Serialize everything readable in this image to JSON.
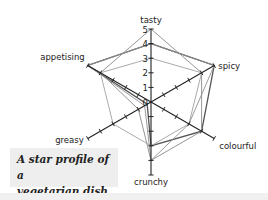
{
  "caption": {
    "line1": "A star profile of a",
    "line2": "vegetarian dish"
  },
  "chart_data": {
    "type": "radar",
    "title": "A star profile of a vegetarian dish",
    "categories": [
      "tasty",
      "spicy",
      "colourful",
      "crunchy",
      "greasy",
      "appetising"
    ],
    "scale": {
      "min": 0,
      "max": 5,
      "ticks": [
        0,
        1,
        2,
        3,
        4,
        5
      ]
    },
    "tick_labels_axis": "tasty",
    "series": [
      {
        "name": "Profile 1",
        "color": "#555555",
        "values": [
          4,
          5,
          4,
          3,
          0.3,
          5
        ]
      },
      {
        "name": "Profile 2",
        "color": "#8a8a8a",
        "values": [
          5,
          4,
          4,
          4,
          1,
          4
        ]
      },
      {
        "name": "Profile 3",
        "color": "#a0a0a0",
        "values": [
          3,
          4,
          3,
          3,
          3,
          4
        ]
      },
      {
        "name": "Profile 4",
        "color": "#909090",
        "values": [
          4,
          5,
          3,
          4,
          0.5,
          5
        ]
      }
    ],
    "grid": false,
    "legend": "none"
  },
  "colors": {
    "axis": "#222222",
    "caption_bg": "#eeeeee",
    "bottom_strip": "#f0f0f0"
  }
}
